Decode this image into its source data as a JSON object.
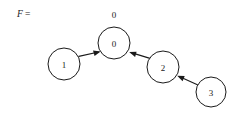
{
  "figure": {
    "caption_prefix": "F",
    "caption_equals": "=",
    "background_color": "#ffffff",
    "stroke_color": "#1a1a1a"
  },
  "graph": {
    "type": "directed-graph",
    "nodes": [
      {
        "id": "node-0",
        "label": "0",
        "cx": 114,
        "cy": 43,
        "r": 16
      },
      {
        "id": "node-1",
        "label": "1",
        "cx": 64,
        "cy": 64,
        "r": 16
      },
      {
        "id": "node-2",
        "label": "2",
        "cx": 163,
        "cy": 67,
        "r": 16
      },
      {
        "id": "node-3",
        "label": "3",
        "cx": 211,
        "cy": 92,
        "r": 15
      }
    ],
    "outer_labels": [
      {
        "id": "outer-label-root",
        "label": "0",
        "x": 114,
        "y": 15
      }
    ],
    "edges": [
      {
        "id": "edge-1-to-0",
        "from": "1",
        "to": "0"
      },
      {
        "id": "edge-2-to-0",
        "from": "2",
        "to": "0"
      },
      {
        "id": "edge-3-to-2",
        "from": "3",
        "to": "2"
      }
    ]
  }
}
